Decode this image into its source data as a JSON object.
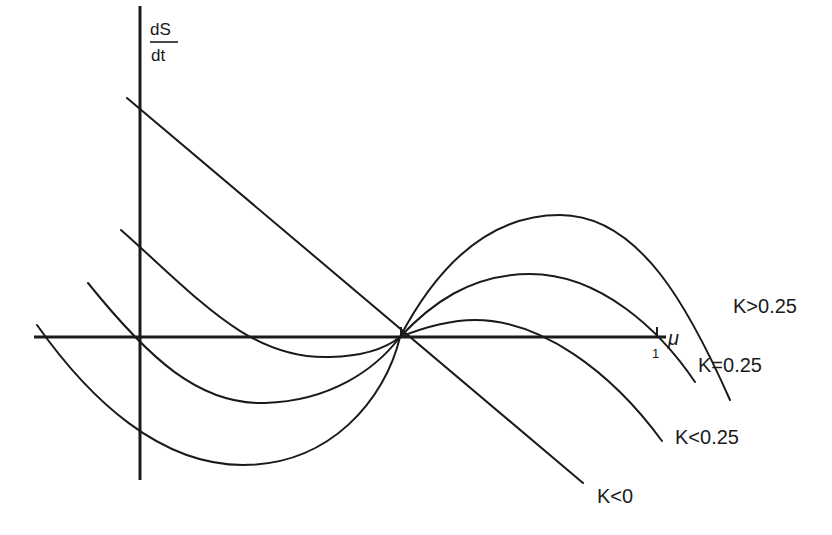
{
  "diagram": {
    "y_axis_label_numerator": "dS",
    "y_axis_label_denominator": "dt",
    "x_axis_label": "μ",
    "x_tick_label": "1",
    "curves": [
      {
        "id": "k-gt-025",
        "label": "K>0.25"
      },
      {
        "id": "k-eq-025",
        "label": "K=0.25"
      },
      {
        "id": "k-lt-025",
        "label": "K<0.25"
      },
      {
        "id": "k-lt-0",
        "label": "K<0"
      }
    ],
    "colors": {
      "ink": "#1a1a1a",
      "background": "#ffffff"
    }
  }
}
